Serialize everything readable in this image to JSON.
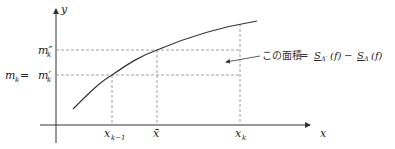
{
  "diagram": {
    "axes": {
      "x_label": "x",
      "y_label": "y"
    },
    "x_ticks": [
      {
        "label": "x",
        "sub": "k−1",
        "x": 112
      },
      {
        "label": "x̄",
        "sub": "",
        "x": 157
      },
      {
        "label": "x",
        "sub": "k",
        "x": 240
      }
    ],
    "y_ticks": [
      {
        "label": "m″",
        "sub": "k",
        "y": 50
      },
      {
        "label": "m",
        "sub": "k",
        "eq": " = ",
        "label2": "m′",
        "sub2": "k",
        "y": 75
      }
    ],
    "annotation": {
      "text_jp": "この面積",
      "equals": " = ",
      "formula_left": "S",
      "formula_left_sub": "Δ′",
      "formula_left_arg": "(f)",
      "minus": " − ",
      "formula_right": "S",
      "formula_right_sub": "Δ",
      "formula_right_arg": "(f)"
    },
    "colors": {
      "curve": "#333333",
      "axis": "#333333",
      "dashed": "#888888"
    }
  }
}
